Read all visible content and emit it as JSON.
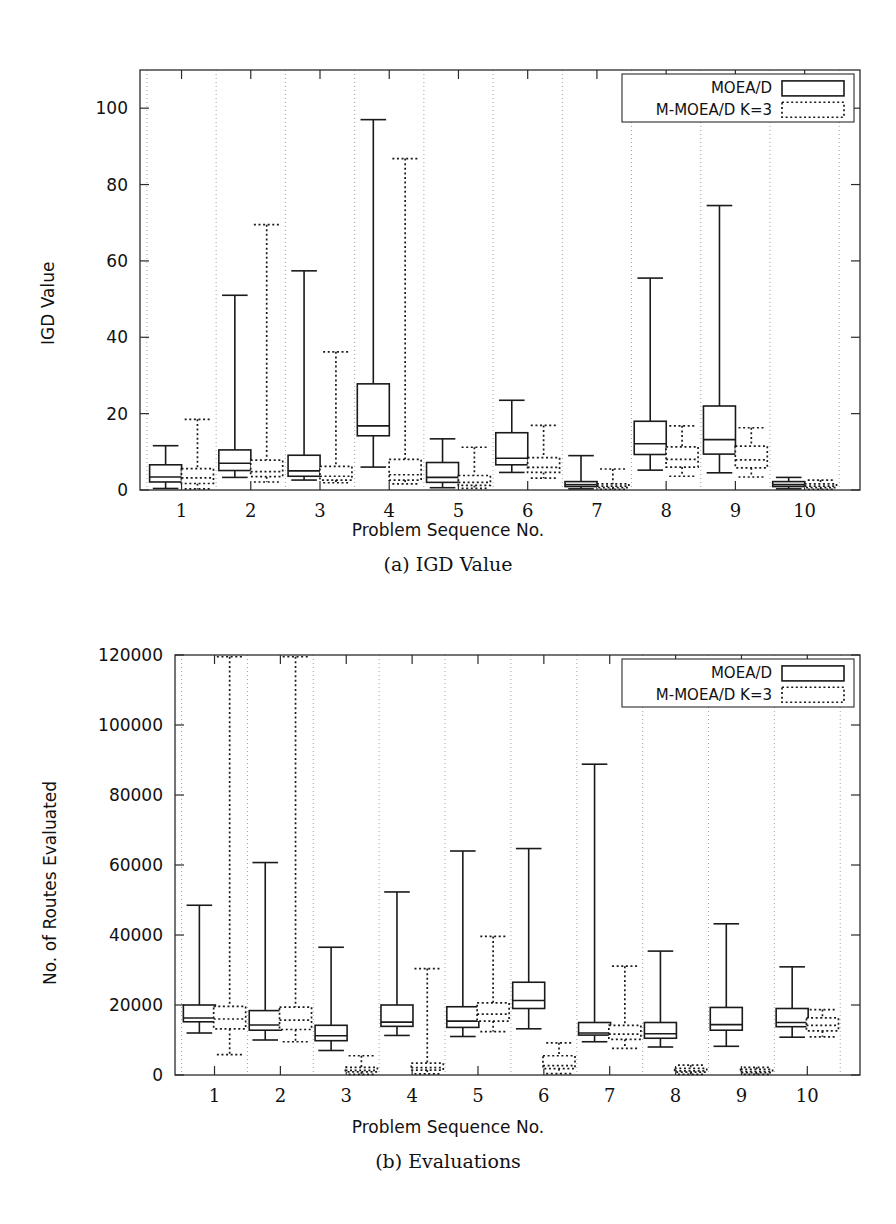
{
  "figures": [
    {
      "id": "a",
      "caption": "(a) IGD Value",
      "legend": {
        "series1": "MOEA/D",
        "series2": "M-MOEA/D K=3"
      },
      "chart_data": {
        "type": "box",
        "title": "(a) IGD Value",
        "xlabel": "Problem Sequence No.",
        "ylabel": "IGD Value",
        "xlim": [
          0.4,
          10.8
        ],
        "ylim": [
          0,
          110
        ],
        "yticks": [
          0,
          20,
          40,
          60,
          80,
          100
        ],
        "ytick_labels": [
          "0",
          "20",
          "40",
          "60",
          "80",
          "100"
        ],
        "xticks": [
          1,
          2,
          3,
          4,
          5,
          6,
          7,
          8,
          9,
          10
        ],
        "xtick_labels": [
          "1",
          "2",
          "3",
          "4",
          "5",
          "6",
          "7",
          "8",
          "9",
          "10"
        ],
        "grid": "vertical-dotted",
        "legend_position": "top-right",
        "categories": [
          "1",
          "2",
          "3",
          "4",
          "5",
          "6",
          "7",
          "8",
          "9",
          "10"
        ],
        "series": [
          {
            "name": "MOEA/D",
            "style": "solid",
            "boxes": [
              {
                "whisker_low": 0.4,
                "q1": 2.1,
                "median": 3.4,
                "q3": 6.6,
                "whisker_high": 11.6
              },
              {
                "whisker_low": 3.3,
                "q1": 5.1,
                "median": 7.0,
                "q3": 10.5,
                "whisker_high": 51.0
              },
              {
                "whisker_low": 2.6,
                "q1": 3.6,
                "median": 5.0,
                "q3": 9.1,
                "whisker_high": 57.4
              },
              {
                "whisker_low": 6.0,
                "q1": 14.2,
                "median": 16.8,
                "q3": 27.8,
                "whisker_high": 97.0
              },
              {
                "whisker_low": 0.6,
                "q1": 2.0,
                "median": 3.3,
                "q3": 7.2,
                "whisker_high": 13.4
              },
              {
                "whisker_low": 4.6,
                "q1": 6.6,
                "median": 8.3,
                "q3": 15.0,
                "whisker_high": 23.5
              },
              {
                "whisker_low": 0.3,
                "q1": 0.9,
                "median": 1.4,
                "q3": 2.2,
                "whisker_high": 9.0
              },
              {
                "whisker_low": 5.2,
                "q1": 9.3,
                "median": 12.1,
                "q3": 18.0,
                "whisker_high": 55.5
              },
              {
                "whisker_low": 4.5,
                "q1": 9.4,
                "median": 13.2,
                "q3": 22.0,
                "whisker_high": 74.5
              },
              {
                "whisker_low": 0.3,
                "q1": 0.9,
                "median": 1.4,
                "q3": 2.2,
                "whisker_high": 3.3
              }
            ]
          },
          {
            "name": "M-MOEA/D K=3",
            "style": "dotted",
            "boxes": [
              {
                "whisker_low": 0.3,
                "q1": 1.7,
                "median": 3.2,
                "q3": 5.6,
                "whisker_high": 18.5
              },
              {
                "whisker_low": 2.1,
                "q1": 3.5,
                "median": 4.8,
                "q3": 7.8,
                "whisker_high": 69.5
              },
              {
                "whisker_low": 1.9,
                "q1": 2.6,
                "median": 3.6,
                "q3": 6.2,
                "whisker_high": 36.2
              },
              {
                "whisker_low": 1.6,
                "q1": 2.6,
                "median": 4.0,
                "q3": 8.0,
                "whisker_high": 86.8
              },
              {
                "whisker_low": 0.4,
                "q1": 1.2,
                "median": 2.0,
                "q3": 3.8,
                "whisker_high": 11.2
              },
              {
                "whisker_low": 3.1,
                "q1": 4.6,
                "median": 5.9,
                "q3": 8.5,
                "whisker_high": 16.9
              },
              {
                "whisker_low": 0.2,
                "q1": 0.6,
                "median": 1.0,
                "q3": 1.6,
                "whisker_high": 5.5
              },
              {
                "whisker_low": 3.6,
                "q1": 6.0,
                "median": 8.0,
                "q3": 11.3,
                "whisker_high": 16.8
              },
              {
                "whisker_low": 3.4,
                "q1": 5.8,
                "median": 7.9,
                "q3": 11.5,
                "whisker_high": 16.3
              },
              {
                "whisker_low": 0.2,
                "q1": 0.6,
                "median": 1.0,
                "q3": 1.6,
                "whisker_high": 2.6
              }
            ]
          }
        ]
      }
    },
    {
      "id": "b",
      "caption": "(b) Evaluations",
      "legend": {
        "series1": "MOEA/D",
        "series2": "M-MOEA/D K=3"
      },
      "chart_data": {
        "type": "box",
        "title": "(b) Evaluations",
        "xlabel": "Problem Sequence No.",
        "ylabel": "No. of Routes Evaluated",
        "xlim": [
          0.4,
          10.8
        ],
        "ylim": [
          0,
          120000
        ],
        "yticks": [
          0,
          20000,
          40000,
          60000,
          80000,
          100000,
          120000
        ],
        "ytick_labels": [
          "0",
          "20000",
          "40000",
          "60000",
          "80000",
          "100000",
          "120000"
        ],
        "xticks": [
          1,
          2,
          3,
          4,
          5,
          6,
          7,
          8,
          9,
          10
        ],
        "xtick_labels": [
          "1",
          "2",
          "3",
          "4",
          "5",
          "6",
          "7",
          "8",
          "9",
          "10"
        ],
        "grid": "vertical-dotted",
        "legend_position": "top-right",
        "categories": [
          "1",
          "2",
          "3",
          "4",
          "5",
          "6",
          "7",
          "8",
          "9",
          "10"
        ],
        "series": [
          {
            "name": "MOEA/D",
            "style": "solid",
            "boxes": [
              {
                "whisker_low": 12000,
                "q1": 15200,
                "median": 16300,
                "q3": 20000,
                "whisker_high": 48500
              },
              {
                "whisker_low": 10000,
                "q1": 12800,
                "median": 14300,
                "q3": 18400,
                "whisker_high": 60700
              },
              {
                "whisker_low": 7000,
                "q1": 9800,
                "median": 11200,
                "q3": 14200,
                "whisker_high": 36500
              },
              {
                "whisker_low": 11300,
                "q1": 13900,
                "median": 15100,
                "q3": 20000,
                "whisker_high": 52300
              },
              {
                "whisker_low": 11000,
                "q1": 13600,
                "median": 15400,
                "q3": 19500,
                "whisker_high": 64000
              },
              {
                "whisker_low": 13200,
                "q1": 19000,
                "median": 21300,
                "q3": 26500,
                "whisker_high": 64700
              },
              {
                "whisker_low": 9500,
                "q1": 11400,
                "median": 12000,
                "q3": 15000,
                "whisker_high": 88800
              },
              {
                "whisker_low": 8000,
                "q1": 10500,
                "median": 11800,
                "q3": 15000,
                "whisker_high": 35400
              },
              {
                "whisker_low": 8200,
                "q1": 12800,
                "median": 14400,
                "q3": 19300,
                "whisker_high": 43200
              },
              {
                "whisker_low": 10800,
                "q1": 13800,
                "median": 15000,
                "q3": 19000,
                "whisker_high": 30900
              }
            ]
          },
          {
            "name": "M-MOEA/D K=3",
            "style": "dotted",
            "boxes": [
              {
                "whisker_low": 5800,
                "q1": 13200,
                "median": 16000,
                "q3": 19600,
                "whisker_high": 119500
              },
              {
                "whisker_low": 9500,
                "q1": 13000,
                "median": 15700,
                "q3": 19400,
                "whisker_high": 119500
              },
              {
                "whisker_low": 200,
                "q1": 900,
                "median": 1300,
                "q3": 2200,
                "whisker_high": 5500
              },
              {
                "whisker_low": 300,
                "q1": 1400,
                "median": 2100,
                "q3": 3400,
                "whisker_high": 30400
              },
              {
                "whisker_low": 12400,
                "q1": 15400,
                "median": 17400,
                "q3": 20600,
                "whisker_high": 39600
              },
              {
                "whisker_low": 400,
                "q1": 1800,
                "median": 2700,
                "q3": 5500,
                "whisker_high": 9200
              },
              {
                "whisker_low": 7600,
                "q1": 10200,
                "median": 11700,
                "q3": 14200,
                "whisker_high": 31100
              },
              {
                "whisker_low": 200,
                "q1": 800,
                "median": 1200,
                "q3": 1900,
                "whisker_high": 2800
              },
              {
                "whisker_low": 200,
                "q1": 700,
                "median": 1000,
                "q3": 1600,
                "whisker_high": 2200
              },
              {
                "whisker_low": 10900,
                "q1": 12600,
                "median": 14200,
                "q3": 16300,
                "whisker_high": 18700
              }
            ]
          }
        ]
      }
    }
  ]
}
